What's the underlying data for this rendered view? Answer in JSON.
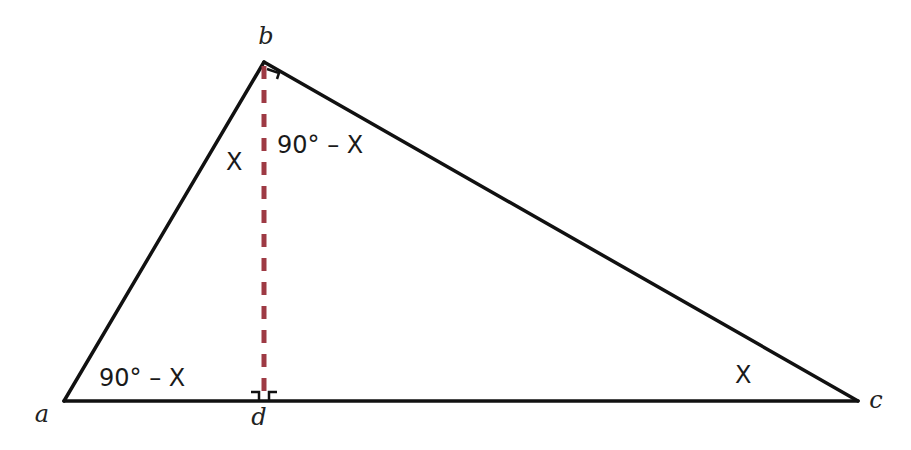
{
  "diagram": {
    "type": "right triangle with altitude",
    "colors": {
      "edge": "#111111",
      "altitude": "#9e3a44",
      "background": "#ffffff"
    },
    "vertices": {
      "a": {
        "label": "a",
        "x": 64,
        "y": 401
      },
      "b": {
        "label": "b",
        "x": 264,
        "y": 62
      },
      "c": {
        "label": "c",
        "x": 858,
        "y": 401
      },
      "d": {
        "label": "d",
        "x": 264,
        "y": 401
      }
    },
    "angle_labels": {
      "at_a": "90° – X",
      "at_b_left": "X",
      "at_b_right": "90° – X",
      "at_c": "X"
    },
    "right_angle_markers": [
      "b",
      "d-left",
      "d-right"
    ]
  }
}
